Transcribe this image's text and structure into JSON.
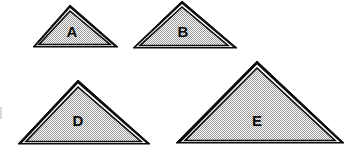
{
  "figure": {
    "title": "",
    "background_color": "#ffffff",
    "width": 356,
    "height": 158,
    "fill_color": "#c8c8c8",
    "outline_color": "#0b0b0b",
    "highlight_color": "#ffffff",
    "label_color": "#0b0b0b",
    "shapes": [
      {
        "id": "triangle-a",
        "label": "A",
        "label_x": 72,
        "label_y": 33,
        "apex_x": 70,
        "apex_y": 5,
        "base_left_x": 33,
        "base_right_x": 118,
        "base_y": 47,
        "points": "70,5 118,47 33,47",
        "inner_points": "70,11 111,45 39,45"
      },
      {
        "id": "triangle-b",
        "label": "B",
        "label_x": 183,
        "label_y": 33,
        "apex_x": 182,
        "apex_y": 1,
        "base_left_x": 133,
        "base_right_x": 237,
        "base_y": 48,
        "points": "182,1 237,48 133,48",
        "inner_points": "182,7 229,46 140,46"
      },
      {
        "id": "triangle-d",
        "label": "D",
        "label_x": 78,
        "label_y": 122,
        "apex_x": 78,
        "apex_y": 80,
        "base_left_x": 18,
        "base_right_x": 150,
        "base_y": 144,
        "points": "78,80 150,144 18,144",
        "inner_points": "78,87 142,142 26,142"
      },
      {
        "id": "triangle-e",
        "label": "E",
        "label_x": 257,
        "label_y": 122,
        "apex_x": 257,
        "apex_y": 61,
        "base_left_x": 176,
        "base_right_x": 344,
        "base_y": 143,
        "points": "257,61 344,143 176,143",
        "inner_points": "257,68 336,141 185,141"
      }
    ]
  }
}
